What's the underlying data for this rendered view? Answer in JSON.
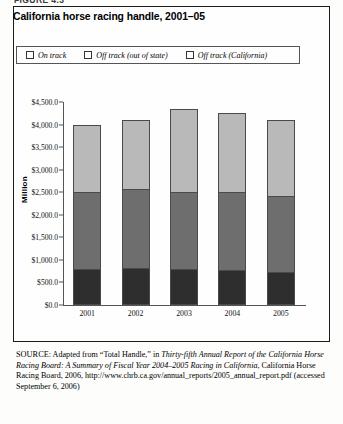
{
  "figure_label": "FIGURE 4.3",
  "title": "California horse racing handle, 2001–05",
  "legend": {
    "items": [
      {
        "label": "On track",
        "color": "#2e2e2e",
        "icon": "legend-swatch-icon"
      },
      {
        "label": "Off track (out of state)",
        "color": "#6e6e6e",
        "icon": "legend-swatch-icon"
      },
      {
        "label": "Off track (California)",
        "color": "#b9b9b9",
        "icon": "legend-swatch-icon"
      }
    ]
  },
  "source": {
    "label": "SOURCE:",
    "line1": " Adapted from “Total Handle,” in ",
    "italic1": "Thirty-fifth Annual Report of the California Horse Racing Board: A Summary of Fiscal Year 2004–2005 Racing in California",
    "line2": ", California Horse Racing Board, 2006, http://www.chrb.ca.gov/annual_reports/2005_annual_report.pdf (accessed September 6, 2006)"
  },
  "chart_data": {
    "type": "bar",
    "title": "California horse racing handle, 2001–05",
    "subtitle": "",
    "xlabel": "",
    "ylabel": "Million",
    "categories": [
      "2001",
      "2002",
      "2003",
      "2004",
      "2005"
    ],
    "series": [
      {
        "name": "On track",
        "color": "#2e2e2e",
        "values": [
          800,
          830,
          790,
          770,
          740
        ]
      },
      {
        "name": "Off track (out of state)",
        "color": "#6e6e6e",
        "values": [
          1700,
          1740,
          1710,
          1740,
          1680
        ]
      },
      {
        "name": "Off track (California)",
        "color": "#b9b9b9",
        "values": [
          1500,
          1530,
          1850,
          1740,
          1680
        ]
      }
    ],
    "totals": [
      4000,
      4100,
      4350,
      4250,
      4100
    ],
    "stacked": true,
    "ylim": [
      0,
      4500
    ],
    "yticks": [
      {
        "value": 4500,
        "label": "$4,500.0"
      },
      {
        "value": 4000,
        "label": "$4,000.0"
      },
      {
        "value": 3500,
        "label": "$3,500.0"
      },
      {
        "value": 3000,
        "label": "$3,000.0"
      },
      {
        "value": 2500,
        "label": "$2,500.0"
      },
      {
        "value": 2000,
        "label": "$2,000.0"
      },
      {
        "value": 1500,
        "label": "$1,500.0"
      },
      {
        "value": 1000,
        "label": "$1,000.0"
      },
      {
        "value": 500,
        "label": "$500.0"
      },
      {
        "value": 0,
        "label": "$0.0"
      }
    ],
    "grid": false,
    "legend_position": "top"
  }
}
